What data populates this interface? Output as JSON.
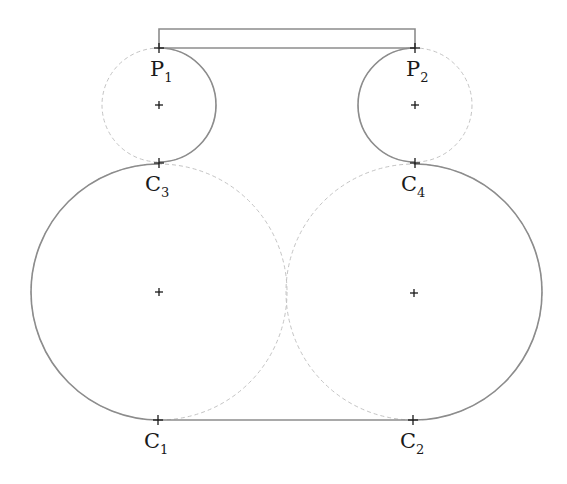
{
  "diagram": {
    "labels": [
      {
        "id": "P1",
        "main": "P",
        "sub": "1"
      },
      {
        "id": "P2",
        "main": "P",
        "sub": "2"
      },
      {
        "id": "C3",
        "main": "C",
        "sub": "3"
      },
      {
        "id": "C4",
        "main": "C",
        "sub": "4"
      },
      {
        "id": "C1",
        "main": "C",
        "sub": "1"
      },
      {
        "id": "C2",
        "main": "C",
        "sub": "2"
      }
    ],
    "colors": {
      "solid_stroke": "#8c8c8c",
      "dashed_stroke": "#c4c4c4",
      "marker": "#1a1a1a"
    }
  }
}
